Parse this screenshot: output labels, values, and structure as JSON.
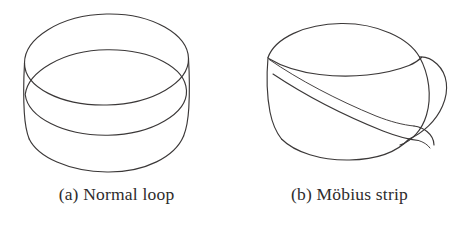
{
  "figure": {
    "background_color": "#ffffff",
    "ink_color": "#3b3838",
    "width": 466,
    "height": 230,
    "panels": [
      {
        "key": "a",
        "label": "(a) Normal loop",
        "subject": "normal-loop",
        "description": "Untwisted cylindrical band (annulus loop) drawn in perspective: an upper ellipse rim, a lower ellipse rim, and two vertical side edges."
      },
      {
        "key": "b",
        "label": "(b) Möbius strip",
        "subject": "mobius-strip",
        "description": "Band with a half twist: the strip folds over on the right side so the inner surface becomes the outer surface, drawn as an ellipse with a diagonal self-crossing edge and a lobe at the right."
      }
    ]
  },
  "captions": {
    "a": "(a) Normal loop",
    "b": "(b) Möbius strip"
  },
  "icons": {
    "loop": "loop-icon",
    "mobius": "mobius-icon"
  }
}
